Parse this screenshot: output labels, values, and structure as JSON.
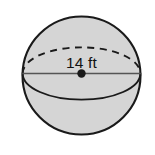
{
  "figure": {
    "shape_name": "sphere",
    "background_color": "#ffffff",
    "fill_color": "#d5d5d5",
    "stroke_color": "#1a1a1a",
    "label": {
      "text": "14 ft",
      "value": "14",
      "unit": "ft",
      "measurement": "diameter"
    },
    "geometry": {
      "center_x": 81.5,
      "center_y": 75.5,
      "radius": 59.5,
      "equator_rx": 58.5,
      "equator_ry": 26,
      "equator_cy": 73.5,
      "diameter_line_y": 73.5,
      "center_dot_radius": 4.2
    },
    "parts": {
      "outline_name": "sphere-outline",
      "back_equator_name": "equator-back-dashed-arc",
      "front_equator_name": "equator-front-solid-arc",
      "diameter_name": "diameter-line",
      "center_name": "center-point"
    }
  }
}
